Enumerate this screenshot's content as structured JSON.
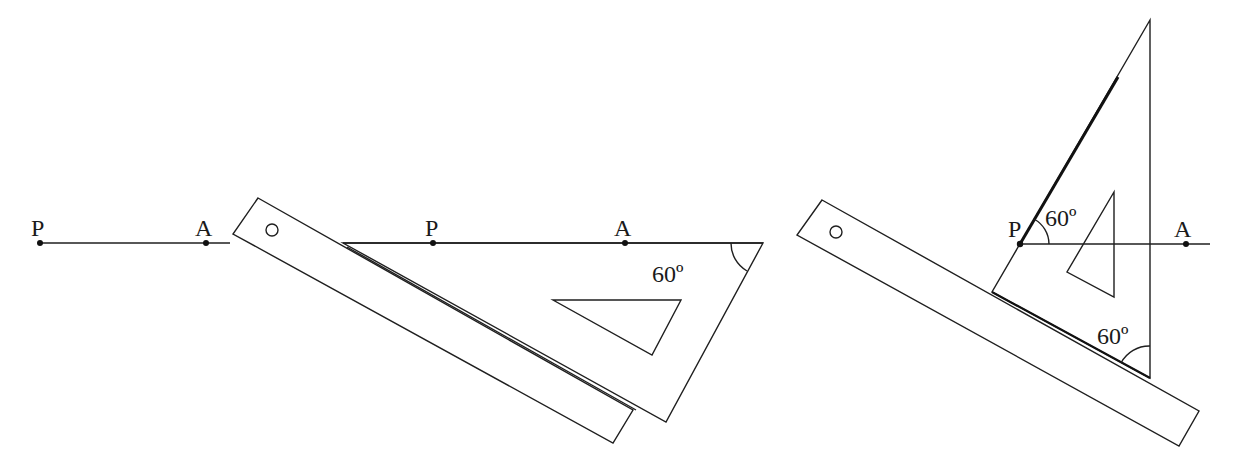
{
  "figure": {
    "colors": {
      "ink": "#1f1f1f",
      "background": "#ffffff"
    },
    "panels": [
      {
        "id": "step-1",
        "points": [
          {
            "label": "P",
            "x": 40,
            "y": 243
          },
          {
            "label": "A",
            "x": 206,
            "y": 243
          }
        ],
        "line": {
          "x1": 40,
          "y1": 243,
          "x2": 230,
          "y2": 243
        }
      },
      {
        "id": "step-2",
        "ruler": {
          "polygon": "258,198 633,410 613,443 233,234",
          "hole": {
            "cx": 272,
            "cy": 230,
            "r": 6
          }
        },
        "set_square": {
          "polygon": "343,243 763,243 666,422",
          "inner": "553,300 681,300 652,355"
        },
        "points": [
          {
            "label": "P",
            "x": 433,
            "y": 243
          },
          {
            "label": "A",
            "x": 625,
            "y": 243
          }
        ],
        "angle_label": "60º",
        "angle_label_pos": {
          "x": 652,
          "y": 282
        }
      },
      {
        "id": "step-3",
        "ruler": {
          "polygon": "822,200 1199,411 1179,446 797,235",
          "hole": {
            "cx": 836,
            "cy": 232,
            "r": 6
          }
        },
        "set_square": {
          "polygon": "1150,20 1150,378 992,292",
          "inner": "1114,192 1114,297 1067,272"
        },
        "points": [
          {
            "label": "P",
            "x": 1020,
            "y": 244
          },
          {
            "label": "A",
            "x": 1186,
            "y": 244
          }
        ],
        "line": {
          "x1": 1020,
          "y1": 244,
          "x2": 1210,
          "y2": 244
        },
        "angle_labels": [
          {
            "text": "60º",
            "x": 1046,
            "y": 226
          },
          {
            "text": "60º",
            "x": 1097,
            "y": 344
          }
        ]
      }
    ]
  },
  "labels": {
    "p1": "P",
    "a1": "A",
    "p2": "P",
    "a2": "A",
    "angle2": "60º",
    "p3": "P",
    "a3": "A",
    "angle3_top": "60º",
    "angle3_bottom": "60º"
  }
}
